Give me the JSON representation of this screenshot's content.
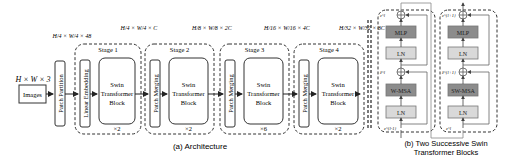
{
  "input": {
    "dims": "H × W × 3",
    "label": "Images"
  },
  "patch_partition": {
    "label": "Patch Partition",
    "out_dims": "H/4 × W/4 × 48"
  },
  "stages": [
    {
      "title": "Stage 1",
      "first_block": "Linear Embedding",
      "block": [
        "Swin",
        "Transformer",
        "Block"
      ],
      "repeat": "×2",
      "out_dims": "H/4 × W/4 × C"
    },
    {
      "title": "Stage 2",
      "first_block": "Patch Merging",
      "block": [
        "Swin",
        "Transformer",
        "Block"
      ],
      "repeat": "×2",
      "out_dims": "H/8 × W/8 × 2C"
    },
    {
      "title": "Stage 3",
      "first_block": "Patch Merging",
      "block": [
        "Swin",
        "Transformer",
        "Block"
      ],
      "repeat": "×6",
      "out_dims": "H/16 × W/16 × 4C"
    },
    {
      "title": "Stage 4",
      "first_block": "Patch Merging",
      "block": [
        "Swin",
        "Transformer",
        "Block"
      ],
      "repeat": "×2",
      "out_dims": "H/32 × W/32 × 8C"
    }
  ],
  "caption_a": "(a) Architecture",
  "blocks_b": [
    {
      "mlp": "MLP",
      "ln_top": "LN",
      "attn": "W-MSA",
      "ln_bottom": "LN",
      "z_out": "z^l",
      "z_mid": "ẑ^l",
      "z_in": "z^{l-1}"
    },
    {
      "mlp": "MLP",
      "ln_top": "LN",
      "attn": "SW-MSA",
      "ln_bottom": "LN",
      "z_out": "z^{l+1}",
      "z_mid": "ẑ^{l+1}",
      "z_in": "z^l"
    }
  ],
  "caption_b": [
    "(b) Two Successive Swin",
    "Transformer Blocks"
  ],
  "colors": {
    "stroke": "#333333",
    "dark_box": "#8c8c8c",
    "light_box": "#d9d9d9",
    "line_gray": "#888888"
  }
}
